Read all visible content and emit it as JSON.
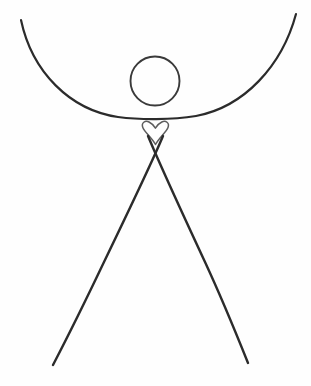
{
  "artwork": {
    "title": "Minimal Stick Figure with Heart",
    "medium": "pen line drawing",
    "background_color": "#fefefe",
    "canvas": {
      "width": 311,
      "height": 386
    }
  },
  "palette": {
    "ink_dark": "#2b2b2b",
    "ink_mid": "#4a4a4a",
    "ink_light": "#5d5d5d",
    "paper": "#fefefe"
  },
  "figure": {
    "parts": [
      {
        "id": "arms-arc",
        "label": "arms-upward-curving-arc",
        "stroke": "#2b2b2b",
        "stroke_width": 2.2,
        "path": "M 21 20 C 32 72, 70 110, 118 117 C 140 120, 172 120, 196 116 C 244 107, 282 66, 296 14",
        "left_tip": [
          21,
          20
        ],
        "right_tip": [
          296,
          14
        ],
        "lowest_point": [
          155,
          119
        ]
      },
      {
        "id": "head-circle",
        "label": "head-circle-outline",
        "stroke": "#3a3a3a",
        "stroke_width": 1.9,
        "center": [
          155,
          81
        ],
        "radius": 24.5
      },
      {
        "id": "heart",
        "label": "heart-outline",
        "stroke": "#5d5d5d",
        "stroke_width": 1.5,
        "path": "M 155.5 144.5 C 152 138, 144.5 132, 142.8 127.5 C 141 122.6, 145.2 120.2, 149 122 C 152.2 123.5, 154.2 126.2, 155.4 128.2 C 156.6 126.2, 158.6 123.5, 161.8 122 C 165.6 120.2, 169.8 122.6, 168 127.5 C 166.3 132, 158.9 138, 155.5 144.5 Z",
        "center": [
          155,
          133
        ],
        "width": 26,
        "height": 24
      },
      {
        "id": "leg-left",
        "label": "left-leg-crossing-stroke",
        "stroke": "#2b2b2b",
        "stroke_width": 2.4,
        "path": "M 163 136 C 158 148, 132 204, 104 262 C 84 304, 66 340, 53 365",
        "top": [
          163,
          136
        ],
        "foot": [
          53,
          365
        ]
      },
      {
        "id": "leg-right",
        "label": "right-leg-crossing-stroke",
        "stroke": "#2b2b2b",
        "stroke_width": 2.4,
        "path": "M 148 136 C 153 148, 178 204, 205 262 C 224 303, 238 338, 248 363",
        "top": [
          148,
          136
        ],
        "foot": [
          248,
          363
        ]
      }
    ],
    "crossing_point": [
      155,
      150
    ]
  }
}
